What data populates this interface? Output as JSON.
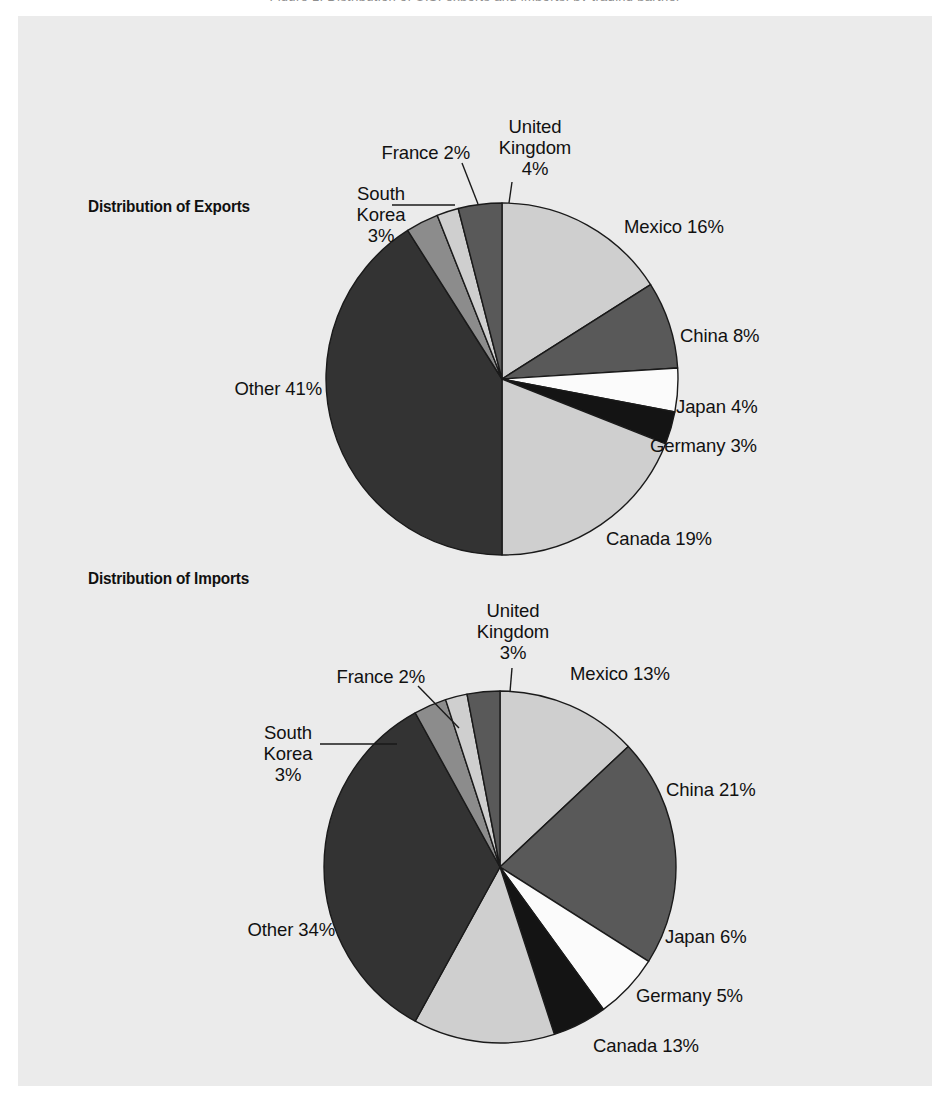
{
  "page": {
    "background_color": "#ebebeb",
    "paper_color": "#ffffff",
    "top_caption_remnant": "Figure 1.  Distribution of U.S. exports and imports, by trading partner",
    "text_color": "#111111"
  },
  "palette": {
    "light_gray": "#cfcfcf",
    "medium_gray": "#8c8c8c",
    "dark_gray": "#595959",
    "charcoal": "#333333",
    "near_black": "#141414",
    "white": "#fbfbfb",
    "outline": "#1a1a1a"
  },
  "charts": [
    {
      "id": "exports",
      "title": "Distribution of Exports",
      "title_x": 88,
      "title_y": 197,
      "cx": 502,
      "cy": 379,
      "r": 176,
      "start_angle": 0,
      "slices": [
        {
          "name": "Mexico",
          "value": 16,
          "label": "Mexico 16%",
          "color": "#cfcfcf",
          "lx": 624,
          "ly": 216,
          "align": "left",
          "leader": null
        },
        {
          "name": "China",
          "value": 8,
          "label": "China 8%",
          "color": "#595959",
          "lx": 680,
          "ly": 325,
          "align": "left",
          "leader": null
        },
        {
          "name": "Japan",
          "value": 4,
          "label": "Japan 4%",
          "color": "#fbfbfb",
          "lx": 676,
          "ly": 396,
          "align": "left",
          "leader": null
        },
        {
          "name": "Germany",
          "value": 3,
          "label": "Germany 3%",
          "color": "#141414",
          "lx": 650,
          "ly": 435,
          "align": "left",
          "leader": null
        },
        {
          "name": "Canada",
          "value": 19,
          "label": "Canada 19%",
          "color": "#cfcfcf",
          "lx": 606,
          "ly": 528,
          "align": "left",
          "leader": null
        },
        {
          "name": "Other",
          "value": 41,
          "label": "Other 41%",
          "color": "#333333",
          "lx": 322,
          "ly": 378,
          "align": "right",
          "leader": null
        },
        {
          "name": "South Korea",
          "value": 3,
          "label": "South\nKorea\n3%",
          "color": "#8c8c8c",
          "lx": 381,
          "ly": 183,
          "align": "center",
          "leader": {
            "type": "h",
            "x1": 392,
            "y1": 205,
            "x2": 455,
            "y2": 205
          }
        },
        {
          "name": "France",
          "value": 2,
          "label": "France 2%",
          "color": "#cfcfcf",
          "lx": 470,
          "ly": 142,
          "align": "right",
          "leader": {
            "type": "d",
            "x1": 462,
            "y1": 163,
            "x2": 478,
            "y2": 204
          }
        },
        {
          "name": "United Kingdom",
          "value": 4,
          "label": "United\nKingdom\n4%",
          "color": "#595959",
          "lx": 535,
          "ly": 116,
          "align": "center",
          "leader": {
            "type": "d",
            "x1": 512,
            "y1": 182,
            "x2": 509,
            "y2": 203
          }
        }
      ]
    },
    {
      "id": "imports",
      "title": "Distribution of Imports",
      "title_x": 88,
      "title_y": 569,
      "cx": 500,
      "cy": 867,
      "r": 176,
      "start_angle": 0,
      "slices": [
        {
          "name": "Mexico",
          "value": 13,
          "label": "Mexico 13%",
          "color": "#cfcfcf",
          "lx": 570,
          "ly": 663,
          "align": "left",
          "leader": null
        },
        {
          "name": "China",
          "value": 21,
          "label": "China 21%",
          "color": "#595959",
          "lx": 666,
          "ly": 779,
          "align": "left",
          "leader": null
        },
        {
          "name": "Japan",
          "value": 6,
          "label": "Japan 6%",
          "color": "#fbfbfb",
          "lx": 665,
          "ly": 926,
          "align": "left",
          "leader": null
        },
        {
          "name": "Germany",
          "value": 5,
          "label": "Germany 5%",
          "color": "#141414",
          "lx": 636,
          "ly": 985,
          "align": "left",
          "leader": null
        },
        {
          "name": "Canada",
          "value": 13,
          "label": "Canada 13%",
          "color": "#cfcfcf",
          "lx": 593,
          "ly": 1035,
          "align": "left",
          "leader": null
        },
        {
          "name": "Other",
          "value": 34,
          "label": "Other 34%",
          "color": "#333333",
          "lx": 335,
          "ly": 919,
          "align": "right",
          "leader": null
        },
        {
          "name": "South Korea",
          "value": 3,
          "label": "South\nKorea\n3%",
          "color": "#8c8c8c",
          "lx": 288,
          "ly": 722,
          "align": "center",
          "leader": {
            "type": "h",
            "x1": 320,
            "y1": 744,
            "x2": 397,
            "y2": 744
          }
        },
        {
          "name": "France",
          "value": 2,
          "label": "France 2%",
          "color": "#cfcfcf",
          "lx": 425,
          "ly": 666,
          "align": "right",
          "leader": {
            "type": "d",
            "x1": 418,
            "y1": 686,
            "x2": 459,
            "y2": 728
          }
        },
        {
          "name": "United Kingdom",
          "value": 3,
          "label": "United\nKingdom\n3%",
          "color": "#595959",
          "lx": 513,
          "ly": 600,
          "align": "center",
          "leader": {
            "type": "d",
            "x1": 512,
            "y1": 668,
            "x2": 510,
            "y2": 692
          }
        }
      ]
    }
  ],
  "chart_data": [
    {
      "type": "pie",
      "title": "Distribution of Exports",
      "unit": "percent",
      "categories": [
        "Mexico",
        "China",
        "Japan",
        "Germany",
        "Canada",
        "Other",
        "South Korea",
        "France",
        "United Kingdom"
      ],
      "values": [
        16,
        8,
        4,
        3,
        19,
        41,
        3,
        2,
        4
      ],
      "labels": [
        "Mexico 16%",
        "China 8%",
        "Japan 4%",
        "Germany 3%",
        "Canada 19%",
        "Other 41%",
        "South Korea 3%",
        "France 2%",
        "United Kingdom 4%"
      ],
      "colors": [
        "#cfcfcf",
        "#595959",
        "#fbfbfb",
        "#141414",
        "#cfcfcf",
        "#333333",
        "#8c8c8c",
        "#cfcfcf",
        "#595959"
      ],
      "total": 100,
      "start_angle_deg": 0,
      "direction": "clockwise",
      "legend": "none",
      "grid": false
    },
    {
      "type": "pie",
      "title": "Distribution of Imports",
      "unit": "percent",
      "categories": [
        "Mexico",
        "China",
        "Japan",
        "Germany",
        "Canada",
        "Other",
        "South Korea",
        "France",
        "United Kingdom"
      ],
      "values": [
        13,
        21,
        6,
        5,
        13,
        34,
        3,
        2,
        3
      ],
      "labels": [
        "Mexico 13%",
        "China 21%",
        "Japan 6%",
        "Germany 5%",
        "Canada 13%",
        "Other 34%",
        "South Korea 3%",
        "France 2%",
        "United Kingdom 3%"
      ],
      "colors": [
        "#cfcfcf",
        "#595959",
        "#fbfbfb",
        "#141414",
        "#cfcfcf",
        "#333333",
        "#8c8c8c",
        "#cfcfcf",
        "#595959"
      ],
      "total": 100,
      "start_angle_deg": 0,
      "direction": "clockwise",
      "legend": "none",
      "grid": false
    }
  ]
}
